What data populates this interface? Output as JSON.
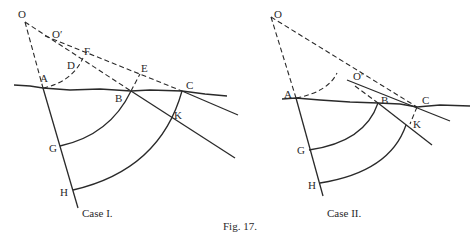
{
  "figure": {
    "caption": "Fig. 17.",
    "case1": {
      "title": "Case I.",
      "labels": {
        "O": "O",
        "O_prime": "O′",
        "F": "F",
        "D": "D",
        "E": "E",
        "A": "A",
        "B": "B",
        "C": "C",
        "K": "K",
        "G": "G",
        "H": "H"
      }
    },
    "case2": {
      "title": "Case II.",
      "labels": {
        "O": "O",
        "O_prime": "O′",
        "A": "A",
        "B": "B",
        "C": "C",
        "K": "K",
        "G": "G",
        "H": "H"
      }
    }
  }
}
